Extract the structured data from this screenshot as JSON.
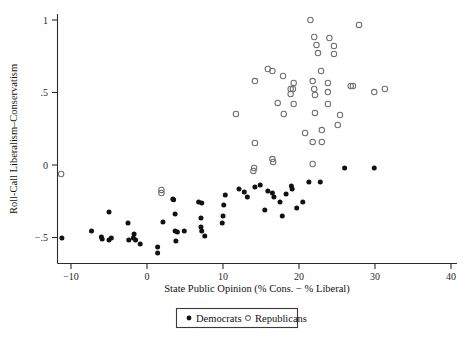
{
  "chart_data": {
    "type": "scatter",
    "title": "",
    "xlabel": "State Public Opinion (% Cons. − % Liberal)",
    "ylabel": "Roll-Call Liberalism–Conservatism",
    "xlim": [
      -13,
      41
    ],
    "ylim": [
      -0.62,
      1.05
    ],
    "xticks": [
      -10,
      0,
      10,
      20,
      30,
      40
    ],
    "xticklabels": [
      "−10",
      "0",
      "10",
      "20",
      "30",
      "40"
    ],
    "yticks": [
      1,
      0.5,
      0,
      -0.5
    ],
    "yticklabels": [
      "1",
      ".5",
      "0",
      "−.5"
    ],
    "grid": false,
    "legend_position": "bottom-center",
    "marker_colors": {
      "democrats": "#111111",
      "republicans": "#6f6f6f"
    },
    "series": [
      {
        "name": "Democrats",
        "marker": "filled-circle",
        "points": [
          [
            -11.2,
            -0.503
          ],
          [
            -7.3,
            -0.455
          ],
          [
            -6.0,
            -0.497
          ],
          [
            -5.9,
            -0.51
          ],
          [
            -5.0,
            -0.324
          ],
          [
            -5.0,
            -0.517
          ],
          [
            -4.7,
            -0.503
          ],
          [
            -2.5,
            -0.4
          ],
          [
            -2.4,
            -0.517
          ],
          [
            -1.7,
            -0.476
          ],
          [
            -1.8,
            -0.503
          ],
          [
            2.1,
            -0.393
          ],
          [
            3.4,
            -0.234
          ],
          [
            3.5,
            -0.24
          ],
          [
            3.7,
            -0.338
          ],
          [
            3.7,
            -0.455
          ],
          [
            4.0,
            -0.462
          ],
          [
            4.9,
            -0.455
          ],
          [
            3.8,
            -0.524
          ],
          [
            6.8,
            -0.255
          ],
          [
            7.2,
            -0.262
          ],
          [
            7.1,
            -0.365
          ],
          [
            7.1,
            -0.427
          ],
          [
            7.2,
            -0.455
          ],
          [
            7.6,
            -0.49
          ],
          [
            10.3,
            -0.207
          ],
          [
            10.1,
            -0.276
          ],
          [
            10.0,
            -0.351
          ],
          [
            9.9,
            -0.4
          ],
          [
            1.4,
            -0.565
          ],
          [
            1.4,
            -0.607
          ],
          [
            -1.5,
            -0.517
          ],
          [
            -0.9,
            -0.545
          ],
          [
            12.1,
            -0.166
          ],
          [
            12.8,
            -0.186
          ],
          [
            13.2,
            -0.221
          ],
          [
            14.2,
            -0.152
          ],
          [
            14.9,
            -0.138
          ],
          [
            15.9,
            -0.179
          ],
          [
            16.5,
            -0.193
          ],
          [
            16.7,
            -0.221
          ],
          [
            17.5,
            -0.255
          ],
          [
            18.3,
            -0.2
          ],
          [
            19.0,
            -0.145
          ],
          [
            19.1,
            -0.166
          ],
          [
            20.5,
            -0.255
          ],
          [
            21.3,
            -0.117
          ],
          [
            22.8,
            -0.117
          ],
          [
            15.5,
            -0.31
          ],
          [
            17.8,
            -0.352
          ],
          [
            19.7,
            -0.296
          ],
          [
            26.0,
            -0.021
          ],
          [
            29.9,
            -0.021
          ]
        ]
      },
      {
        "name": "Republicans",
        "marker": "open-circle",
        "points": [
          [
            -11.3,
            -0.062
          ],
          [
            1.9,
            -0.172
          ],
          [
            1.9,
            -0.193
          ],
          [
            14.1,
            -0.021
          ],
          [
            14.0,
            -0.041
          ],
          [
            16.5,
            0.041
          ],
          [
            16.6,
            0.021
          ],
          [
            11.7,
            0.352
          ],
          [
            14.2,
            0.579
          ],
          [
            15.9,
            0.662
          ],
          [
            18.9,
            0.524
          ],
          [
            18.9,
            0.49
          ],
          [
            21.5,
            1.0
          ],
          [
            22.0,
            0.883
          ],
          [
            22.3,
            0.828
          ],
          [
            22.5,
            0.772
          ],
          [
            24.0,
            0.876
          ],
          [
            24.6,
            0.821
          ],
          [
            24.6,
            0.766
          ],
          [
            22.9,
            0.648
          ],
          [
            27.9,
            0.966
          ],
          [
            16.5,
            0.648
          ],
          [
            17.9,
            0.614
          ],
          [
            19.3,
            0.566
          ],
          [
            19.2,
            0.524
          ],
          [
            21.8,
            0.579
          ],
          [
            22.0,
            0.524
          ],
          [
            22.1,
            0.483
          ],
          [
            23.8,
            0.566
          ],
          [
            23.8,
            0.503
          ],
          [
            26.8,
            0.545
          ],
          [
            27.1,
            0.545
          ],
          [
            29.9,
            0.503
          ],
          [
            31.3,
            0.524
          ],
          [
            17.2,
            0.428
          ],
          [
            19.3,
            0.421
          ],
          [
            23.8,
            0.421
          ],
          [
            25.4,
            0.345
          ],
          [
            25.1,
            0.276
          ],
          [
            18.0,
            0.352
          ],
          [
            22.1,
            0.359
          ],
          [
            14.2,
            0.152
          ],
          [
            21.8,
            0.159
          ],
          [
            21.8,
            0.007
          ],
          [
            20.8,
            0.221
          ],
          [
            23.0,
            0.159
          ],
          [
            23.0,
            0.241
          ]
        ]
      }
    ]
  },
  "legend": {
    "entries": [
      {
        "label": "Democrats",
        "marker": "filled-circle"
      },
      {
        "label": "Republicans",
        "marker": "open-circle"
      }
    ]
  }
}
